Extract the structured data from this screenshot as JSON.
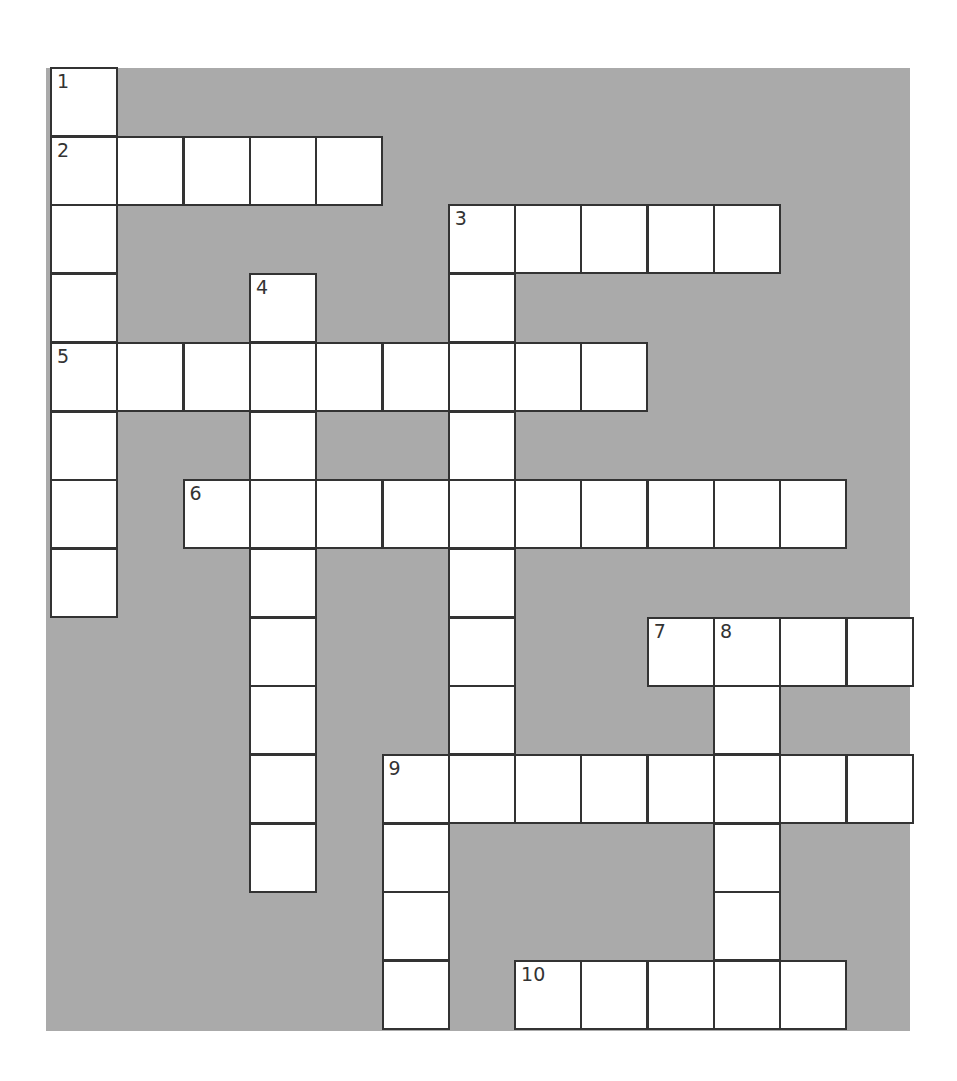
{
  "puzzle": {
    "type": "crossword",
    "rows": 14,
    "cols": 13,
    "colors": {
      "background": "#aaaaaa",
      "cell": "#ffffff",
      "border": "#333333"
    },
    "entries": [
      {
        "number": "1",
        "direction": "down",
        "row": 0,
        "col": 0,
        "length": 8
      },
      {
        "number": "2",
        "direction": "across",
        "row": 1,
        "col": 0,
        "length": 5
      },
      {
        "number": "3",
        "direction": "across",
        "row": 2,
        "col": 6,
        "length": 5
      },
      {
        "number": "3",
        "direction": "down",
        "row": 2,
        "col": 6,
        "length": 9
      },
      {
        "number": "4",
        "direction": "down",
        "row": 3,
        "col": 3,
        "length": 9
      },
      {
        "number": "5",
        "direction": "across",
        "row": 4,
        "col": 0,
        "length": 9
      },
      {
        "number": "6",
        "direction": "across",
        "row": 6,
        "col": 2,
        "length": 10
      },
      {
        "number": "7",
        "direction": "across",
        "row": 8,
        "col": 9,
        "length": 4
      },
      {
        "number": "8",
        "direction": "down",
        "row": 8,
        "col": 10,
        "length": 6
      },
      {
        "number": "9",
        "direction": "across",
        "row": 10,
        "col": 5,
        "length": 8
      },
      {
        "number": "9",
        "direction": "down",
        "row": 10,
        "col": 5,
        "length": 4
      },
      {
        "number": "10",
        "direction": "across",
        "row": 13,
        "col": 7,
        "length": 5
      }
    ],
    "numbers": [
      {
        "label": "1",
        "row": 0,
        "col": 0
      },
      {
        "label": "2",
        "row": 1,
        "col": 0
      },
      {
        "label": "3",
        "row": 2,
        "col": 6
      },
      {
        "label": "4",
        "row": 3,
        "col": 3
      },
      {
        "label": "5",
        "row": 4,
        "col": 0
      },
      {
        "label": "6",
        "row": 6,
        "col": 2
      },
      {
        "label": "7",
        "row": 8,
        "col": 9
      },
      {
        "label": "8",
        "row": 8,
        "col": 10
      },
      {
        "label": "9",
        "row": 10,
        "col": 5
      },
      {
        "label": "10",
        "row": 13,
        "col": 7
      }
    ]
  }
}
